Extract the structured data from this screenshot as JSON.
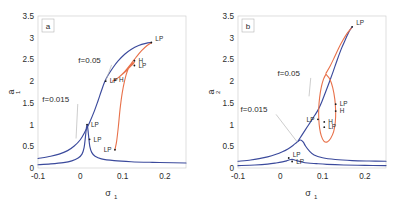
{
  "figure": {
    "background": "#ffffff",
    "panels": [
      "a",
      "b"
    ]
  },
  "colors": {
    "series_f0015": "#3b4a9c",
    "series_f005": "#3b4a9c",
    "isola": "#e8714a",
    "frame": "#d0d0d0",
    "text": "#2b2b2b",
    "leader": "#b8b8b8"
  },
  "chart_data": [
    {
      "type": "line",
      "panel": "a",
      "panel_label": "a",
      "title": "",
      "xlabel": "σ",
      "xlabel_sub": "1",
      "ylabel": "a",
      "ylabel_sub": "1",
      "xlim": [
        -0.1,
        0.25
      ],
      "ylim": [
        0,
        3.5
      ],
      "xticks": [
        -0.1,
        0,
        0.1,
        0.2
      ],
      "xticklabels": [
        "-0.1",
        "0",
        "0.1",
        "0.2"
      ],
      "yticks": [
        0,
        0.5,
        1,
        1.5,
        2,
        2.5,
        3,
        3.5
      ],
      "yticklabels": [
        "0",
        "0.5",
        "1",
        "1.5",
        "2",
        "2.5",
        "3",
        "3.5"
      ],
      "grid": false,
      "legend": "annotations",
      "series": [
        {
          "name": "f=0.015",
          "color": "#3b4a9c",
          "points": [
            [
              -0.1,
              0.075
            ],
            [
              -0.07,
              0.095
            ],
            [
              -0.04,
              0.125
            ],
            [
              -0.02,
              0.165
            ],
            [
              -0.005,
              0.23
            ],
            [
              0.004,
              0.32
            ],
            [
              0.009,
              0.47
            ],
            [
              0.012,
              0.7
            ],
            [
              0.0145,
              0.93
            ],
            [
              0.016,
              1.0
            ],
            [
              0.0175,
              0.93
            ],
            [
              0.019,
              0.8
            ],
            [
              0.0205,
              0.66
            ],
            [
              0.0225,
              0.5
            ],
            [
              0.027,
              0.36
            ],
            [
              0.035,
              0.27
            ],
            [
              0.05,
              0.21
            ],
            [
              0.08,
              0.17
            ],
            [
              0.12,
              0.145
            ],
            [
              0.17,
              0.13
            ],
            [
              0.22,
              0.12
            ],
            [
              0.25,
              0.115
            ]
          ]
        },
        {
          "name": "f=0.05",
          "color": "#3b4a9c",
          "points": [
            [
              -0.1,
              0.22
            ],
            [
              -0.07,
              0.27
            ],
            [
              -0.05,
              0.32
            ],
            [
              -0.03,
              0.4
            ],
            [
              -0.015,
              0.5
            ],
            [
              0.0,
              0.65
            ],
            [
              0.012,
              0.85
            ],
            [
              0.022,
              1.05
            ],
            [
              0.032,
              1.28
            ],
            [
              0.042,
              1.55
            ],
            [
              0.05,
              1.78
            ],
            [
              0.058,
              1.99
            ],
            [
              0.066,
              2.14
            ],
            [
              0.078,
              2.32
            ],
            [
              0.09,
              2.47
            ],
            [
              0.105,
              2.62
            ],
            [
              0.12,
              2.73
            ],
            [
              0.138,
              2.82
            ],
            [
              0.155,
              2.87
            ],
            [
              0.168,
              2.89
            ]
          ]
        },
        {
          "name": "isola-branch",
          "color": "#e8714a",
          "points": [
            [
              0.082,
              0.42
            ],
            [
              0.086,
              0.62
            ],
            [
              0.09,
              0.95
            ],
            [
              0.094,
              1.35
            ],
            [
              0.099,
              1.72
            ],
            [
              0.105,
              2.02
            ],
            [
              0.112,
              2.25
            ],
            [
              0.12,
              2.38
            ],
            [
              0.128,
              2.43
            ],
            [
              0.12,
              2.35
            ],
            [
              0.11,
              2.25
            ],
            [
              0.1,
              2.16
            ],
            [
              0.09,
              2.08
            ],
            [
              0.082,
              2.03
            ],
            [
              0.076,
              2.0
            ],
            [
              0.082,
              2.03
            ],
            [
              0.092,
              2.1
            ],
            [
              0.105,
              2.22
            ],
            [
              0.12,
              2.4
            ],
            [
              0.132,
              2.55
            ],
            [
              0.145,
              2.7
            ],
            [
              0.158,
              2.82
            ],
            [
              0.168,
              2.88
            ]
          ]
        }
      ],
      "critical_points": [
        {
          "label": "LP",
          "x": 0.168,
          "y": 2.89,
          "anchor": "right-top"
        },
        {
          "label": "H",
          "x": 0.128,
          "y": 2.47,
          "anchor": "right"
        },
        {
          "label": "LP",
          "x": 0.128,
          "y": 2.36,
          "anchor": "right"
        },
        {
          "label": "H",
          "x": 0.082,
          "y": 2.02,
          "anchor": "right"
        },
        {
          "label": "LP",
          "x": 0.06,
          "y": 2.0,
          "anchor": "right"
        },
        {
          "label": "LP",
          "x": 0.016,
          "y": 1.0,
          "anchor": "right"
        },
        {
          "label": "LP",
          "x": 0.022,
          "y": 0.66,
          "anchor": "right"
        },
        {
          "label": "LP",
          "x": 0.082,
          "y": 0.42,
          "anchor": "left-bottom"
        }
      ],
      "annotations": [
        {
          "text": "f=0.05",
          "tx": 0.022,
          "ty": 2.42,
          "px": 0.06,
          "py": 2.0
        },
        {
          "text": "f=0.015",
          "tx": -0.058,
          "ty": 1.52,
          "px": -0.01,
          "py": 0.68
        }
      ]
    },
    {
      "type": "line",
      "panel": "b",
      "panel_label": "b",
      "title": "",
      "xlabel": "σ",
      "xlabel_sub": "1",
      "ylabel": "a",
      "ylabel_sub": "2",
      "xlim": [
        -0.1,
        0.25
      ],
      "ylim": [
        0,
        3.5
      ],
      "xticks": [
        -0.1,
        0,
        0.1,
        0.2
      ],
      "xticklabels": [
        "-0.1",
        "0",
        "0.1",
        "0.2"
      ],
      "yticks": [
        0,
        0.5,
        1,
        1.5,
        2,
        2.5,
        3,
        3.5
      ],
      "yticklabels": [
        "0",
        "0.5",
        "1",
        "1.5",
        "2",
        "2.5",
        "3",
        "3.5"
      ],
      "grid": false,
      "legend": "annotations",
      "series": [
        {
          "name": "f=0.015",
          "color": "#3b4a9c",
          "points": [
            [
              -0.1,
              0.055
            ],
            [
              -0.06,
              0.07
            ],
            [
              -0.03,
              0.09
            ],
            [
              -0.01,
              0.115
            ],
            [
              0.005,
              0.14
            ],
            [
              0.015,
              0.165
            ],
            [
              0.022,
              0.19
            ],
            [
              0.028,
              0.2
            ],
            [
              0.034,
              0.185
            ],
            [
              0.04,
              0.165
            ],
            [
              0.05,
              0.14
            ],
            [
              0.065,
              0.115
            ],
            [
              0.085,
              0.1
            ],
            [
              0.11,
              0.085
            ],
            [
              0.15,
              0.07
            ],
            [
              0.2,
              0.06
            ],
            [
              0.25,
              0.055
            ]
          ]
        },
        {
          "name": "f=0.05",
          "color": "#3b4a9c",
          "points": [
            [
              -0.1,
              0.155
            ],
            [
              -0.07,
              0.185
            ],
            [
              -0.05,
              0.215
            ],
            [
              -0.03,
              0.255
            ],
            [
              -0.01,
              0.315
            ],
            [
              0.005,
              0.375
            ],
            [
              0.018,
              0.44
            ],
            [
              0.03,
              0.52
            ],
            [
              0.04,
              0.6
            ],
            [
              0.048,
              0.645
            ],
            [
              0.054,
              0.6
            ],
            [
              0.06,
              0.5
            ],
            [
              0.068,
              0.4
            ],
            [
              0.08,
              0.3
            ],
            [
              0.1,
              0.235
            ],
            [
              0.13,
              0.195
            ],
            [
              0.17,
              0.17
            ],
            [
              0.21,
              0.16
            ],
            [
              0.25,
              0.155
            ]
          ]
        },
        {
          "name": "f=0.05-upper",
          "color": "#3b4a9c",
          "points": [
            [
              0.042,
              0.62
            ],
            [
              0.05,
              0.74
            ],
            [
              0.058,
              0.86
            ],
            [
              0.066,
              0.98
            ],
            [
              0.074,
              1.1
            ],
            [
              0.082,
              1.22
            ],
            [
              0.09,
              1.35
            ],
            [
              0.098,
              1.52
            ],
            [
              0.106,
              1.72
            ],
            [
              0.115,
              1.95
            ],
            [
              0.125,
              2.22
            ],
            [
              0.135,
              2.5
            ],
            [
              0.145,
              2.76
            ],
            [
              0.155,
              2.98
            ],
            [
              0.163,
              3.15
            ],
            [
              0.17,
              3.25
            ]
          ]
        },
        {
          "name": "isola",
          "color": "#e8714a",
          "closed": true,
          "points": [
            [
              0.108,
              2.16
            ],
            [
              0.117,
              2.05
            ],
            [
              0.124,
              1.85
            ],
            [
              0.129,
              1.58
            ],
            [
              0.131,
              1.3
            ],
            [
              0.13,
              1.05
            ],
            [
              0.126,
              0.83
            ],
            [
              0.119,
              0.68
            ],
            [
              0.111,
              0.6
            ],
            [
              0.103,
              0.62
            ],
            [
              0.097,
              0.74
            ],
            [
              0.093,
              0.92
            ],
            [
              0.091,
              1.14
            ],
            [
              0.091,
              1.38
            ],
            [
              0.093,
              1.62
            ],
            [
              0.097,
              1.86
            ],
            [
              0.102,
              2.04
            ],
            [
              0.108,
              2.16
            ]
          ]
        },
        {
          "name": "isola-tail",
          "color": "#e8714a",
          "points": [
            [
              0.108,
              2.18
            ],
            [
              0.118,
              2.35
            ],
            [
              0.128,
              2.55
            ],
            [
              0.138,
              2.76
            ],
            [
              0.148,
              2.94
            ],
            [
              0.158,
              3.1
            ],
            [
              0.168,
              3.22
            ]
          ]
        }
      ],
      "critical_points": [
        {
          "label": "LP",
          "x": 0.17,
          "y": 3.25,
          "anchor": "right-top"
        },
        {
          "label": "LP",
          "x": 0.131,
          "y": 1.47,
          "anchor": "right"
        },
        {
          "label": "H",
          "x": 0.131,
          "y": 1.31,
          "anchor": "right"
        },
        {
          "label": "LP",
          "x": 0.089,
          "y": 1.12,
          "anchor": "left"
        },
        {
          "label": "H",
          "x": 0.104,
          "y": 1.06,
          "anchor": "right"
        },
        {
          "label": "LP",
          "x": 0.104,
          "y": 0.94,
          "anchor": "right"
        },
        {
          "label": "LP",
          "x": 0.02,
          "y": 0.23,
          "anchor": "right-top"
        },
        {
          "label": "LP",
          "x": 0.028,
          "y": 0.15,
          "anchor": "right"
        }
      ],
      "annotations": [
        {
          "text": "f=0.05",
          "tx": 0.02,
          "ty": 2.12,
          "px": 0.068,
          "py": 1.65
        },
        {
          "text": "f=0.015",
          "tx": -0.062,
          "ty": 1.28,
          "px": 0.04,
          "py": 0.6
        }
      ]
    }
  ]
}
